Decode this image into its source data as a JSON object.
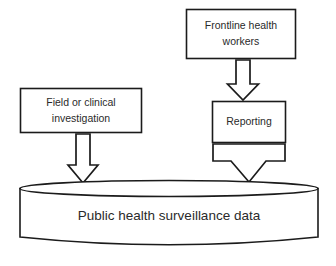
{
  "diagram": {
    "type": "flow-diagram",
    "background_color": "#ffffff",
    "stroke_color": "#1b1b1b",
    "text_color": "#2a2a2a",
    "nodes": [
      {
        "id": "frontline-health-workers",
        "shape": "rectangle",
        "line1": "Frontline health",
        "line2": "workers"
      },
      {
        "id": "field-or-clinical-investigation",
        "shape": "rectangle",
        "line1": "Field  or clinical",
        "line2": "investigation"
      },
      {
        "id": "reporting",
        "shape": "rectangle",
        "line1": "Reporting"
      },
      {
        "id": "public-health-surveillance-data",
        "shape": "cylinder",
        "line1": "Public health surveillance data"
      }
    ],
    "arrows": [
      {
        "id": "workers-to-reporting",
        "direction": "down",
        "from": "frontline-health-workers",
        "to": "reporting",
        "style": "hollow-block"
      },
      {
        "id": "investigation-to-data-store",
        "direction": "down",
        "from": "field-or-clinical-investigation",
        "to": "public-health-surveillance-data",
        "style": "hollow-block"
      },
      {
        "id": "reporting-to-data-store",
        "direction": "down",
        "from": "reporting",
        "to": "public-health-surveillance-data",
        "style": "hollow-block-wide"
      }
    ]
  }
}
